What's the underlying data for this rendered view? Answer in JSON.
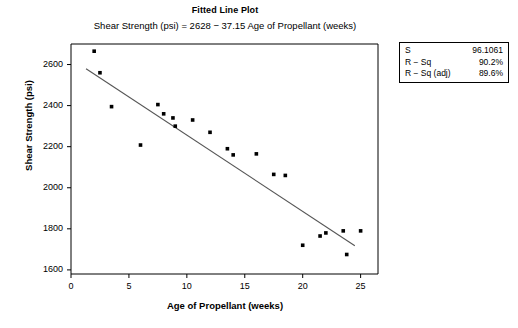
{
  "header": {
    "title": "Fitted Line Plot",
    "subtitle": "Shear Strength (psi) = 2628 − 37.15 Age of Propellant (weeks)"
  },
  "stats": {
    "rows": [
      {
        "key": "S",
        "value": "96.1061"
      },
      {
        "key": "R − Sq",
        "value": "90.2%"
      },
      {
        "key": "R − Sq (adj)",
        "value": "89.6%"
      }
    ]
  },
  "chart_data": {
    "type": "scatter",
    "title": "Fitted Line Plot",
    "subtitle": "Shear Strength (psi) = 2628 − 37.15 Age of Propellant (weeks)",
    "xlabel": "Age of Propellant (weeks)",
    "ylabel": "Shear Strength (psi)",
    "xlim": [
      0,
      26.5
    ],
    "ylim": [
      1580,
      2700
    ],
    "xticks": [
      0,
      5,
      10,
      15,
      20,
      25
    ],
    "yticks": [
      1600,
      1800,
      2000,
      2200,
      2400,
      2600
    ],
    "grid": false,
    "legend": false,
    "marker_color": "#000000",
    "line_color": "#555555",
    "points": [
      {
        "x": 2.0,
        "y": 2665
      },
      {
        "x": 2.5,
        "y": 2560
      },
      {
        "x": 3.5,
        "y": 2395
      },
      {
        "x": 6.0,
        "y": 2208
      },
      {
        "x": 7.5,
        "y": 2405
      },
      {
        "x": 8.0,
        "y": 2360
      },
      {
        "x": 8.8,
        "y": 2340
      },
      {
        "x": 9.0,
        "y": 2300
      },
      {
        "x": 10.5,
        "y": 2330
      },
      {
        "x": 12.0,
        "y": 2270
      },
      {
        "x": 13.5,
        "y": 2190
      },
      {
        "x": 14.0,
        "y": 2160
      },
      {
        "x": 16.0,
        "y": 2165
      },
      {
        "x": 17.5,
        "y": 2065
      },
      {
        "x": 18.5,
        "y": 2060
      },
      {
        "x": 20.0,
        "y": 1720
      },
      {
        "x": 21.5,
        "y": 1765
      },
      {
        "x": 22.0,
        "y": 1780
      },
      {
        "x": 23.5,
        "y": 1790
      },
      {
        "x": 23.8,
        "y": 1675
      },
      {
        "x": 25.0,
        "y": 1790
      }
    ],
    "fit_line": {
      "intercept": 2628,
      "slope": -37.15,
      "x_start": 1.3,
      "x_end": 24.5
    }
  }
}
